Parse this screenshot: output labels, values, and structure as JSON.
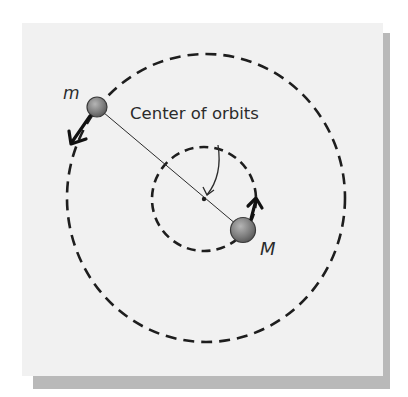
{
  "diagram": {
    "labels": {
      "small_mass": "m",
      "large_mass": "M",
      "center": "Center of orbits"
    },
    "colors": {
      "panel": "#f1f1f1",
      "shadow": "#b9b9b9",
      "ink": "#1e1e1e",
      "ball": "#8a8a8a"
    }
  }
}
